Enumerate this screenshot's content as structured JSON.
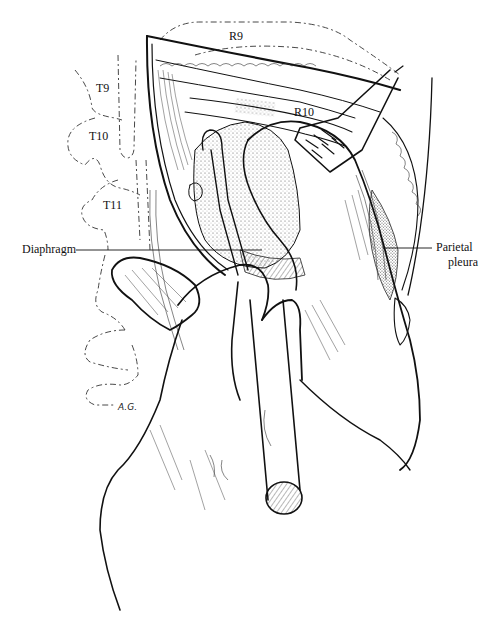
{
  "figure": {
    "type": "surgical-illustration",
    "colors": {
      "ink": "#111111",
      "background": "#ffffff",
      "stipple": "#555555"
    },
    "labels": {
      "r9": "R9",
      "r10": "R10",
      "t9": "T9",
      "t10": "T10",
      "t11": "T11",
      "diaphragm": "Diaphragm",
      "parietal_pleura_line1": "Parietal",
      "parietal_pleura_line2": "pleura"
    },
    "artist_signature": "A.G."
  }
}
